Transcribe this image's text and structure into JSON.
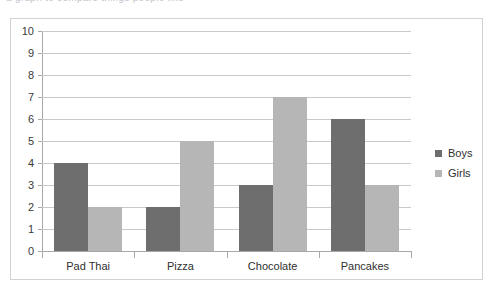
{
  "clipped_caption": "a graph to compare things people like",
  "chart_data": {
    "type": "bar",
    "title": "",
    "subtitle": "",
    "xlabel": "",
    "ylabel": "",
    "categories": [
      "Pad Thai",
      "Pizza",
      "Chocolate",
      "Pancakes"
    ],
    "series": [
      {
        "name": "Boys",
        "color": "#6e6e6e",
        "values": [
          4,
          2,
          3,
          6
        ]
      },
      {
        "name": "Girls",
        "color": "#b6b6b6",
        "values": [
          2,
          5,
          7,
          3
        ]
      }
    ],
    "ylim": [
      0,
      10
    ],
    "ytick_step": 1,
    "ytick_labels": [
      "10",
      "9",
      "8",
      "7",
      "6",
      "5",
      "4",
      "3",
      "2",
      "1",
      "0"
    ],
    "grid": true,
    "grid_axis": "y",
    "legend_position": "right",
    "background_color": "#ffffff",
    "grid_color": "#c9c9c9",
    "axis_color": "#a8a8a8",
    "border_color": "#d2d2d2"
  }
}
